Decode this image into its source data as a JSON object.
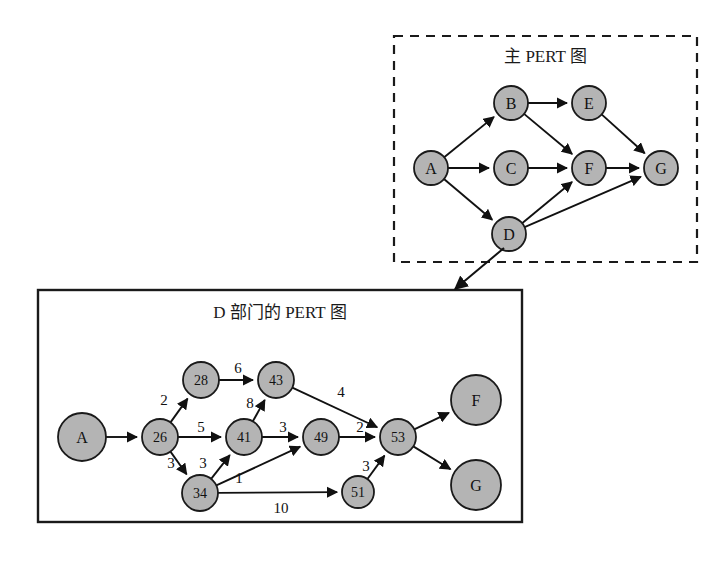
{
  "figure": {
    "background": "#ffffff",
    "node_fill": "#b4b4b4",
    "node_stroke": "#1a1a1a",
    "edge_color": "#111111",
    "width": 726,
    "height": 561
  },
  "main_graph": {
    "title": "主 PERT 图",
    "border_style": "dashed",
    "box": {
      "x": 394,
      "y": 36,
      "w": 303,
      "h": 226
    },
    "nodes": [
      {
        "id": "A",
        "label": "A",
        "cx": 431,
        "cy": 168,
        "r": 17
      },
      {
        "id": "B",
        "label": "B",
        "cx": 511,
        "cy": 103,
        "r": 17
      },
      {
        "id": "C",
        "label": "C",
        "cx": 511,
        "cy": 168,
        "r": 17
      },
      {
        "id": "D",
        "label": "D",
        "cx": 509,
        "cy": 234,
        "r": 17
      },
      {
        "id": "E",
        "label": "E",
        "cx": 589,
        "cy": 103,
        "r": 17
      },
      {
        "id": "F",
        "label": "F",
        "cx": 589,
        "cy": 168,
        "r": 17
      },
      {
        "id": "G",
        "label": "G",
        "cx": 661,
        "cy": 168,
        "r": 17
      }
    ],
    "edges": [
      {
        "from": "A",
        "to": "B"
      },
      {
        "from": "A",
        "to": "C"
      },
      {
        "from": "A",
        "to": "D"
      },
      {
        "from": "B",
        "to": "E"
      },
      {
        "from": "B",
        "to": "F"
      },
      {
        "from": "C",
        "to": "F"
      },
      {
        "from": "D",
        "to": "F"
      },
      {
        "from": "D",
        "to": "G"
      },
      {
        "from": "E",
        "to": "G"
      },
      {
        "from": "F",
        "to": "G"
      }
    ]
  },
  "detail_graph": {
    "title": "D 部门的 PERT 图",
    "border_style": "solid",
    "box": {
      "x": 38,
      "y": 290,
      "w": 484,
      "h": 232
    },
    "nodes": [
      {
        "id": "A",
        "label": "A",
        "cx": 82,
        "cy": 437,
        "r": 24
      },
      {
        "id": "n26",
        "label": "26",
        "cx": 160,
        "cy": 437,
        "r": 18
      },
      {
        "id": "n28",
        "label": "28",
        "cx": 201,
        "cy": 380,
        "r": 18
      },
      {
        "id": "n34",
        "label": "34",
        "cx": 200,
        "cy": 493,
        "r": 18
      },
      {
        "id": "n41",
        "label": "41",
        "cx": 244,
        "cy": 437,
        "r": 18
      },
      {
        "id": "n43",
        "label": "43",
        "cx": 276,
        "cy": 380,
        "r": 18
      },
      {
        "id": "n49",
        "label": "49",
        "cx": 321,
        "cy": 437,
        "r": 18
      },
      {
        "id": "n51",
        "label": "51",
        "cx": 358,
        "cy": 492,
        "r": 16
      },
      {
        "id": "n53",
        "label": "53",
        "cx": 398,
        "cy": 437,
        "r": 18
      },
      {
        "id": "F",
        "label": "F",
        "cx": 476,
        "cy": 400,
        "r": 25
      },
      {
        "id": "G",
        "label": "G",
        "cx": 476,
        "cy": 485,
        "r": 25
      }
    ],
    "edges": [
      {
        "from": "A",
        "to": "n26",
        "weight": "",
        "lx": 0,
        "ly": 0
      },
      {
        "from": "n26",
        "to": "n28",
        "weight": "2",
        "lx": 164,
        "ly": 400
      },
      {
        "from": "n26",
        "to": "n41",
        "weight": "5",
        "lx": 201,
        "ly": 427
      },
      {
        "from": "n26",
        "to": "n34",
        "weight": "3",
        "lx": 171,
        "ly": 463
      },
      {
        "from": "n28",
        "to": "n43",
        "weight": "6",
        "lx": 238,
        "ly": 368
      },
      {
        "from": "n34",
        "to": "n41",
        "weight": "3",
        "lx": 203,
        "ly": 463
      },
      {
        "from": "n41",
        "to": "n43",
        "weight": "8",
        "lx": 250,
        "ly": 403
      },
      {
        "from": "n41",
        "to": "n49",
        "weight": "3",
        "lx": 283,
        "ly": 427
      },
      {
        "from": "n34",
        "to": "n49",
        "weight": "1",
        "lx": 239,
        "ly": 478
      },
      {
        "from": "n34",
        "to": "n51",
        "weight": "10",
        "lx": 281,
        "ly": 508
      },
      {
        "from": "n43",
        "to": "n53",
        "weight": "4",
        "lx": 341,
        "ly": 392
      },
      {
        "from": "n49",
        "to": "n53",
        "weight": "2",
        "lx": 360,
        "ly": 427
      },
      {
        "from": "n51",
        "to": "n53",
        "weight": "3",
        "lx": 366,
        "ly": 466
      },
      {
        "from": "n53",
        "to": "F",
        "weight": "",
        "lx": 0,
        "ly": 0
      },
      {
        "from": "n53",
        "to": "G",
        "weight": "",
        "lx": 0,
        "ly": 0
      }
    ]
  },
  "drilldown_arrow": {
    "name": "drilldown-arrow",
    "from_node": "D",
    "to_box": "detail_graph",
    "x1": 504,
    "y1": 248,
    "x2": 455,
    "y2": 289
  }
}
